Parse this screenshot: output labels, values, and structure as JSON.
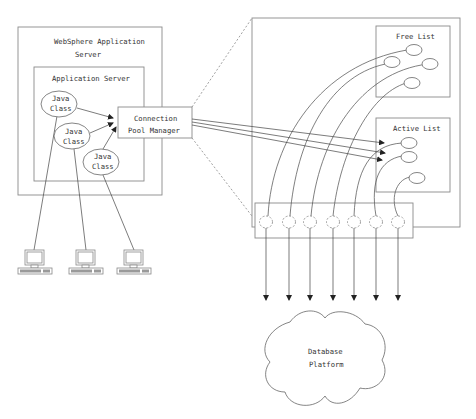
{
  "diagram": {
    "websphere_server": {
      "label_line1": "WebSphere Application",
      "label_line2": "Server"
    },
    "application_server": {
      "label": "Application Server"
    },
    "java_classes": [
      {
        "line1": "Java",
        "line2": "Class"
      },
      {
        "line1": "Java",
        "line2": "Class"
      },
      {
        "line1": "Java",
        "line2": "Class"
      }
    ],
    "connection_pool_manager": {
      "label_line1": "Connection",
      "label_line2": "Pool Manager"
    },
    "pool": {
      "free_list_label": "Free List",
      "active_list_label": "Active List",
      "free_list_count": 4,
      "active_list_count": 3,
      "connection_slots": 7
    },
    "database": {
      "label_line1": "Database",
      "label_line2": "Platform"
    },
    "clients": {
      "count": 3,
      "icon": "desktop-computer-icon"
    }
  }
}
